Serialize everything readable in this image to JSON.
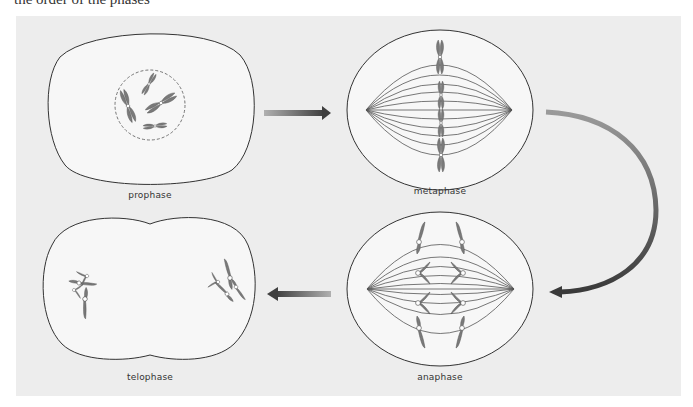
{
  "header": {
    "cut_off_text": "the order of the phases"
  },
  "colors": {
    "panel_bg": "#ededed",
    "cell_fill": "#f7f7f7",
    "outline": "#333333",
    "chromosome": "#7a7a7a",
    "spindle": "#555555",
    "arrow_light": "#aaaaaa",
    "arrow_dark": "#444444"
  },
  "phases": [
    {
      "id": "prophase",
      "label": "prophase",
      "position": "top-left",
      "order": 1
    },
    {
      "id": "metaphase",
      "label": "metaphase",
      "position": "top-right",
      "order": 2
    },
    {
      "id": "anaphase",
      "label": "anaphase",
      "position": "bottom-right",
      "order": 3
    },
    {
      "id": "telophase",
      "label": "telophase",
      "position": "bottom-left",
      "order": 4
    }
  ],
  "arrows": [
    {
      "from": "prophase",
      "to": "metaphase",
      "shape": "straight-right"
    },
    {
      "from": "metaphase",
      "to": "anaphase",
      "shape": "curved-down-left"
    },
    {
      "from": "anaphase",
      "to": "telophase",
      "shape": "straight-left"
    }
  ]
}
